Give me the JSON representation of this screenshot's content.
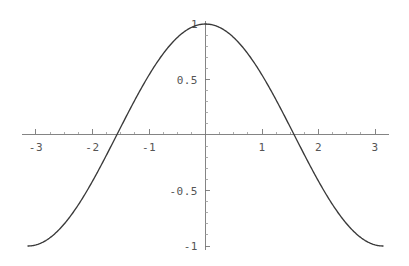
{
  "chart_data": {
    "type": "line",
    "title": "",
    "subtitle": "",
    "xlabel": "",
    "ylabel": "",
    "function": "cos(x)",
    "xlim": [
      -3.14159265,
      3.14159265
    ],
    "ylim": [
      -1,
      1
    ],
    "grid": false,
    "legend": null,
    "axes_style": "crossing-at-origin",
    "x_tick_labels": [
      "-3",
      "-2",
      "-1",
      "1",
      "2",
      "3"
    ],
    "x_tick_values": [
      -3,
      -2,
      -1,
      1,
      2,
      3
    ],
    "y_tick_labels": [
      "1",
      "0.5",
      "-0.5",
      "-1"
    ],
    "y_tick_values": [
      1,
      0.5,
      -0.5,
      -1
    ],
    "x_minor_step": 0.25,
    "y_minor_step": 0.1,
    "x": [
      -3.14159265,
      -3.04159265,
      -2.94159265,
      -2.84159265,
      -2.74159265,
      -2.64159265,
      -2.54159265,
      -2.44159265,
      -2.34159265,
      -2.24159265,
      -2.14159265,
      -2.04159265,
      -1.94159265,
      -1.84159265,
      -1.74159265,
      -1.64159265,
      -1.57079633,
      -1.54159265,
      -1.44159265,
      -1.34159265,
      -1.24159265,
      -1.14159265,
      -1.04159265,
      -0.94159265,
      -0.84159265,
      -0.74159265,
      -0.64159265,
      -0.54159265,
      -0.44159265,
      -0.34159265,
      -0.24159265,
      -0.14159265,
      -0.04159265,
      0,
      0.04159265,
      0.14159265,
      0.24159265,
      0.34159265,
      0.44159265,
      0.54159265,
      0.64159265,
      0.74159265,
      0.84159265,
      0.94159265,
      1.04159265,
      1.14159265,
      1.24159265,
      1.34159265,
      1.44159265,
      1.54159265,
      1.57079633,
      1.64159265,
      1.74159265,
      1.84159265,
      1.94159265,
      2.04159265,
      2.14159265,
      2.24159265,
      2.34159265,
      2.44159265,
      2.54159265,
      2.64159265,
      2.74159265,
      2.84159265,
      2.94159265,
      3.04159265,
      3.14159265
    ],
    "y": [
      -1,
      -0.995,
      -0.98,
      -0.956,
      -0.922,
      -0.879,
      -0.827,
      -0.766,
      -0.698,
      -0.622,
      -0.54,
      -0.452,
      -0.36,
      -0.265,
      -0.168,
      -0.07,
      0,
      0.029,
      0.127,
      0.225,
      0.322,
      0.415,
      0.505,
      0.588,
      0.666,
      0.737,
      0.801,
      0.857,
      0.904,
      0.942,
      0.971,
      0.99,
      0.999,
      1,
      0.999,
      0.99,
      0.971,
      0.942,
      0.904,
      0.857,
      0.801,
      0.737,
      0.666,
      0.588,
      0.505,
      0.415,
      0.322,
      0.225,
      0.127,
      0.029,
      0,
      -0.07,
      -0.168,
      -0.265,
      -0.36,
      -0.452,
      -0.54,
      -0.622,
      -0.698,
      -0.766,
      -0.827,
      -0.879,
      -0.922,
      -0.956,
      -0.98,
      -0.995,
      -1
    ],
    "colors": {
      "curve": "#3a3a3a",
      "axis": "#777777",
      "label": "#555555",
      "background": "#ffffff"
    }
  }
}
